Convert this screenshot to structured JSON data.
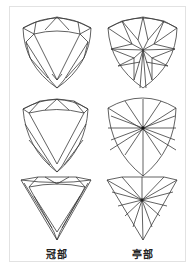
{
  "figure": {
    "title": "",
    "stroke_color": "#3a3a3a",
    "frame_color": "#e2e2e2",
    "rows": [
      {
        "shape": "curved-triangle (trillion, convex)",
        "crown": "crown-facet-diagram-1",
        "pavilion": "pavilion-star-diagram-1"
      },
      {
        "shape": "curved-triangle (trillion, rounded)",
        "crown": "crown-facet-diagram-2",
        "pavilion": "pavilion-radial-diagram-2"
      },
      {
        "shape": "straight triangle (trillion, flat)",
        "crown": "crown-facet-diagram-3",
        "pavilion": "pavilion-fan-diagram-3"
      }
    ],
    "labels": {
      "crown": "冠部",
      "pavilion": "亭部"
    }
  }
}
